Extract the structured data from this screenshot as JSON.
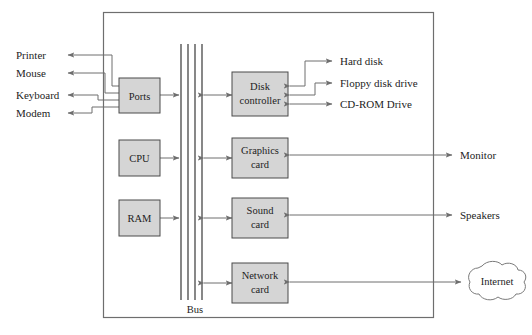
{
  "diagram": {
    "case_label": "system unit case",
    "bus_label": "Bus",
    "colors": {
      "box_fill": "#d5d5d5",
      "box_stroke": "#4a4a4a",
      "case_stroke": "#6e6e6e",
      "wire": "#6e6e6e",
      "bus": "#555555",
      "background": "#ffffff",
      "text": "#1d1d1d"
    },
    "bus": {
      "label": "Bus",
      "line_count": 4
    },
    "internal_components": [
      {
        "id": "ports",
        "label_line1": "Ports",
        "label_line2": ""
      },
      {
        "id": "disk-controller",
        "label_line1": "Disk",
        "label_line2": "controller"
      },
      {
        "id": "cpu",
        "label_line1": "CPU",
        "label_line2": ""
      },
      {
        "id": "graphics-card",
        "label_line1": "Graphics",
        "label_line2": "card"
      },
      {
        "id": "ram",
        "label_line1": "RAM",
        "label_line2": ""
      },
      {
        "id": "sound-card",
        "label_line1": "Sound",
        "label_line2": "card"
      },
      {
        "id": "network-card",
        "label_line1": "Network",
        "label_line2": "card"
      }
    ],
    "peripherals_left": [
      {
        "id": "printer",
        "label": "Printer"
      },
      {
        "id": "mouse",
        "label": "Mouse"
      },
      {
        "id": "keyboard",
        "label": "Keyboard"
      },
      {
        "id": "modem",
        "label": "Modem"
      }
    ],
    "peripherals_storage": [
      {
        "id": "hard-disk",
        "label": "Hard disk"
      },
      {
        "id": "floppy-disk-drive",
        "label": "Floppy disk drive"
      },
      {
        "id": "cd-rom-drive",
        "label": "CD-ROM Drive"
      }
    ],
    "peripherals_right": [
      {
        "id": "monitor",
        "label": "Monitor"
      },
      {
        "id": "speakers",
        "label": "Speakers"
      }
    ],
    "network": {
      "label": "Internet"
    }
  }
}
